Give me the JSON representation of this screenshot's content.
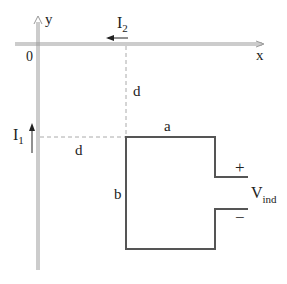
{
  "diagram": {
    "axes": {
      "x_label": "x",
      "y_label": "y",
      "origin_label": "0"
    },
    "currents": {
      "i2": {
        "symbol": "I",
        "subscript": "2",
        "direction": "left (negative x)"
      },
      "i1": {
        "symbol": "I",
        "subscript": "1",
        "direction": "up (positive y)"
      }
    },
    "dimensions": {
      "vertical_distance": "d",
      "horizontal_distance": "d",
      "loop_width": "a",
      "loop_height": "b"
    },
    "terminals": {
      "plus": "+",
      "minus": "−",
      "voltage_symbol": "V",
      "voltage_subscript": "ind"
    },
    "colors": {
      "wire": "#555555",
      "axis": "#999999",
      "dashed": "#aaaaaa",
      "text": "#222222"
    }
  }
}
